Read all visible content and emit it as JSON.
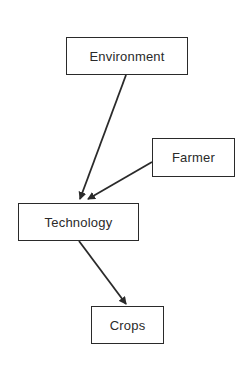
{
  "diagram": {
    "nodes": [
      {
        "id": "environment",
        "label": "Environment"
      },
      {
        "id": "farmer",
        "label": "Farmer"
      },
      {
        "id": "technology",
        "label": "Technology"
      },
      {
        "id": "crops",
        "label": "Crops"
      }
    ],
    "edges": [
      {
        "from": "environment",
        "to": "technology"
      },
      {
        "from": "farmer",
        "to": "technology"
      },
      {
        "from": "technology",
        "to": "crops"
      }
    ],
    "colors": {
      "stroke": "#2a2a2a",
      "background": "#ffffff"
    }
  }
}
